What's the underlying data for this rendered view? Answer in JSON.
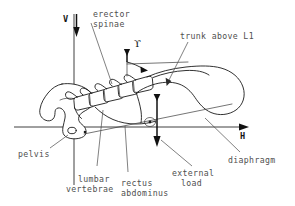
{
  "figure": {
    "background_color": "#ffffff",
    "ink_color": "#1b1b1b",
    "label_color": "#4f4f4f"
  },
  "axes": {
    "vertical": {
      "label": "V",
      "name": "vertical-axis",
      "arrow_direction": "down"
    },
    "horizontal": {
      "label": "H",
      "name": "horizontal-axis",
      "arrow_direction": "right"
    }
  },
  "angle_marker": {
    "symbol": "ϒ",
    "name": "trunk-angle-gamma"
  },
  "labels": {
    "erector_spinae": "erector\nspinae",
    "erector_spinae_line1": "erector",
    "erector_spinae_line2": "spinae",
    "trunk_above_l1": "trunk above L1",
    "pelvis": "pelvis",
    "lumbar_vertebrae_line1": "lumbar",
    "lumbar_vertebrae_line2": "vertebrae",
    "rectus_abdominus_line1": "rectus",
    "rectus_abdominus_line2": "abdominus",
    "external_load_line1": "external",
    "external_load_line2": "load",
    "diaphragm": "diaphragm"
  },
  "vectors": [
    {
      "name": "erector-spinae-force",
      "direction": "down",
      "label": "erector spinae"
    },
    {
      "name": "external-load-force",
      "direction": "down",
      "label": "external load"
    },
    {
      "name": "rectus-abdominus-force",
      "direction": "up",
      "label": "rectus abdominus"
    },
    {
      "name": "vertical-reference",
      "direction": "down",
      "label": "V"
    },
    {
      "name": "horizontal-reference",
      "direction": "right",
      "label": "H"
    }
  ],
  "anatomy": [
    {
      "name": "pelvis-outline",
      "label": "pelvis"
    },
    {
      "name": "lumbar-vertebrae-stack",
      "label": "lumbar vertebrae",
      "count": 5
    },
    {
      "name": "trunk-outline",
      "label": "trunk above L1"
    },
    {
      "name": "diaphragm-line",
      "label": "diaphragm"
    },
    {
      "name": "hip-joint-marker",
      "label": "hip joint"
    }
  ]
}
